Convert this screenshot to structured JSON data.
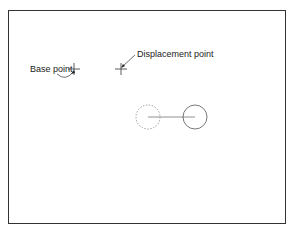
{
  "diagram": {
    "labels": {
      "base_point": "Base point",
      "displacement_point": "Displacement point"
    },
    "colors": {
      "border": "#333333",
      "stroke": "#444444",
      "dashed": "#888888",
      "background": "#ffffff"
    },
    "elements": {
      "original_circle": "dashed",
      "moved_circle": "solid",
      "connector": "line"
    }
  }
}
